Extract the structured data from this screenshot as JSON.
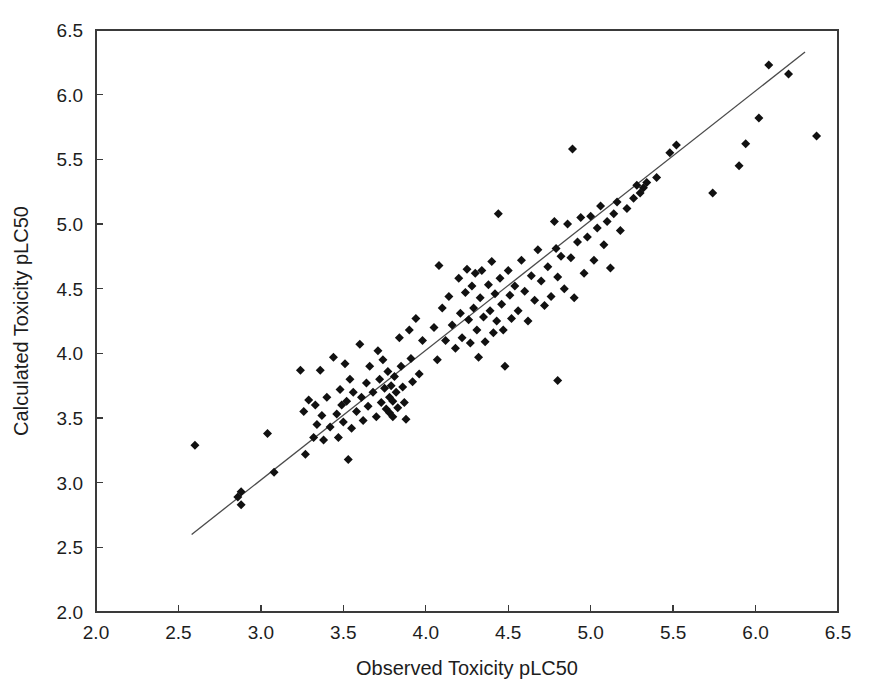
{
  "chart_data": {
    "type": "scatter",
    "title": "",
    "xlabel": "Observed Toxicity pLC50",
    "ylabel": "Calculated Toxicity pLC50",
    "xlim": [
      2.0,
      6.5
    ],
    "ylim": [
      2.0,
      6.5
    ],
    "xticks": [
      "2.0",
      "2.5",
      "3.0",
      "3.5",
      "4.0",
      "4.5",
      "5.0",
      "5.5",
      "6.0",
      "6.5"
    ],
    "yticks": [
      "2.0",
      "2.5",
      "3.0",
      "3.5",
      "4.0",
      "4.5",
      "5.0",
      "5.5",
      "6.0",
      "6.5"
    ],
    "xtick_values": [
      2.0,
      2.5,
      3.0,
      3.5,
      4.0,
      4.5,
      5.0,
      5.5,
      6.0,
      6.5
    ],
    "ytick_values": [
      2.0,
      2.5,
      3.0,
      3.5,
      4.0,
      4.5,
      5.0,
      5.5,
      6.0,
      6.5
    ],
    "grid": false,
    "legend": false,
    "marker": "diamond",
    "marker_color": "#111111",
    "marker_size": 9,
    "fit_line": {
      "label": "regression-line",
      "color": "#4a4a4a",
      "x_start": 2.58,
      "y_start": 2.6,
      "x_end": 6.3,
      "y_end": 6.33
    },
    "series": [
      {
        "name": "Observed vs Calculated",
        "points": [
          [
            2.6,
            3.29
          ],
          [
            2.86,
            2.89
          ],
          [
            2.88,
            2.93
          ],
          [
            2.88,
            2.83
          ],
          [
            3.04,
            3.38
          ],
          [
            3.08,
            3.08
          ],
          [
            3.24,
            3.87
          ],
          [
            3.26,
            3.55
          ],
          [
            3.27,
            3.22
          ],
          [
            3.29,
            3.64
          ],
          [
            3.32,
            3.35
          ],
          [
            3.33,
            3.6
          ],
          [
            3.34,
            3.45
          ],
          [
            3.36,
            3.87
          ],
          [
            3.37,
            3.52
          ],
          [
            3.38,
            3.33
          ],
          [
            3.4,
            3.66
          ],
          [
            3.42,
            3.43
          ],
          [
            3.44,
            3.97
          ],
          [
            3.46,
            3.53
          ],
          [
            3.47,
            3.35
          ],
          [
            3.48,
            3.72
          ],
          [
            3.49,
            3.6
          ],
          [
            3.5,
            3.47
          ],
          [
            3.51,
            3.92
          ],
          [
            3.52,
            3.63
          ],
          [
            3.53,
            3.18
          ],
          [
            3.54,
            3.8
          ],
          [
            3.55,
            3.42
          ],
          [
            3.56,
            3.7
          ],
          [
            3.58,
            3.55
          ],
          [
            3.6,
            4.07
          ],
          [
            3.61,
            3.66
          ],
          [
            3.62,
            3.48
          ],
          [
            3.64,
            3.77
          ],
          [
            3.65,
            3.59
          ],
          [
            3.66,
            3.9
          ],
          [
            3.68,
            3.7
          ],
          [
            3.7,
            3.51
          ],
          [
            3.71,
            4.02
          ],
          [
            3.72,
            3.8
          ],
          [
            3.73,
            3.62
          ],
          [
            3.74,
            3.95
          ],
          [
            3.75,
            3.73
          ],
          [
            3.76,
            3.57
          ],
          [
            3.77,
            3.86
          ],
          [
            3.78,
            3.66
          ],
          [
            3.78,
            3.54
          ],
          [
            3.79,
            3.75
          ],
          [
            3.8,
            3.63
          ],
          [
            3.8,
            3.51
          ],
          [
            3.81,
            3.82
          ],
          [
            3.82,
            3.7
          ],
          [
            3.83,
            3.58
          ],
          [
            3.84,
            4.12
          ],
          [
            3.85,
            3.9
          ],
          [
            3.86,
            3.74
          ],
          [
            3.87,
            3.62
          ],
          [
            3.88,
            3.49
          ],
          [
            3.9,
            4.18
          ],
          [
            3.91,
            3.96
          ],
          [
            3.92,
            3.78
          ],
          [
            3.94,
            4.27
          ],
          [
            3.96,
            3.84
          ],
          [
            3.98,
            4.1
          ],
          [
            4.05,
            4.2
          ],
          [
            4.07,
            3.95
          ],
          [
            4.08,
            4.68
          ],
          [
            4.1,
            4.35
          ],
          [
            4.12,
            4.1
          ],
          [
            4.14,
            4.44
          ],
          [
            4.16,
            4.22
          ],
          [
            4.18,
            4.04
          ],
          [
            4.2,
            4.58
          ],
          [
            4.21,
            4.31
          ],
          [
            4.22,
            4.12
          ],
          [
            4.24,
            4.47
          ],
          [
            4.25,
            4.65
          ],
          [
            4.26,
            4.26
          ],
          [
            4.27,
            4.08
          ],
          [
            4.28,
            4.52
          ],
          [
            4.29,
            4.35
          ],
          [
            4.3,
            4.62
          ],
          [
            4.31,
            4.18
          ],
          [
            4.32,
            3.97
          ],
          [
            4.33,
            4.43
          ],
          [
            4.34,
            4.64
          ],
          [
            4.35,
            4.28
          ],
          [
            4.36,
            4.09
          ],
          [
            4.38,
            4.53
          ],
          [
            4.39,
            4.33
          ],
          [
            4.4,
            4.71
          ],
          [
            4.41,
            4.16
          ],
          [
            4.42,
            4.46
          ],
          [
            4.43,
            4.25
          ],
          [
            4.44,
            5.08
          ],
          [
            4.45,
            4.58
          ],
          [
            4.46,
            4.38
          ],
          [
            4.47,
            4.18
          ],
          [
            4.48,
            3.9
          ],
          [
            4.5,
            4.64
          ],
          [
            4.51,
            4.45
          ],
          [
            4.52,
            4.27
          ],
          [
            4.54,
            4.52
          ],
          [
            4.56,
            4.33
          ],
          [
            4.58,
            4.72
          ],
          [
            4.6,
            4.48
          ],
          [
            4.62,
            4.25
          ],
          [
            4.64,
            4.6
          ],
          [
            4.66,
            4.41
          ],
          [
            4.68,
            4.8
          ],
          [
            4.7,
            4.56
          ],
          [
            4.72,
            4.37
          ],
          [
            4.74,
            4.67
          ],
          [
            4.76,
            4.44
          ],
          [
            4.78,
            5.02
          ],
          [
            4.79,
            4.81
          ],
          [
            4.8,
            4.59
          ],
          [
            4.8,
            3.79
          ],
          [
            4.82,
            4.75
          ],
          [
            4.84,
            4.5
          ],
          [
            4.86,
            5.0
          ],
          [
            4.88,
            4.74
          ],
          [
            4.89,
            5.58
          ],
          [
            4.9,
            4.43
          ],
          [
            4.92,
            4.86
          ],
          [
            4.94,
            5.05
          ],
          [
            4.96,
            4.62
          ],
          [
            4.98,
            4.9
          ],
          [
            5.0,
            5.06
          ],
          [
            5.02,
            4.72
          ],
          [
            5.04,
            4.97
          ],
          [
            5.06,
            5.14
          ],
          [
            5.08,
            4.84
          ],
          [
            5.1,
            5.02
          ],
          [
            5.12,
            4.66
          ],
          [
            5.14,
            5.08
          ],
          [
            5.16,
            5.17
          ],
          [
            5.18,
            4.95
          ],
          [
            5.22,
            5.12
          ],
          [
            5.26,
            5.2
          ],
          [
            5.28,
            5.3
          ],
          [
            5.3,
            5.24
          ],
          [
            5.32,
            5.28
          ],
          [
            5.34,
            5.32
          ],
          [
            5.4,
            5.36
          ],
          [
            5.48,
            5.55
          ],
          [
            5.52,
            5.61
          ],
          [
            5.74,
            5.24
          ],
          [
            5.9,
            5.45
          ],
          [
            5.94,
            5.62
          ],
          [
            6.02,
            5.82
          ],
          [
            6.08,
            6.23
          ],
          [
            6.2,
            6.16
          ],
          [
            6.37,
            5.68
          ]
        ]
      }
    ]
  },
  "axes": {
    "x_axis_name": "x-axis",
    "y_axis_name": "y-axis"
  }
}
